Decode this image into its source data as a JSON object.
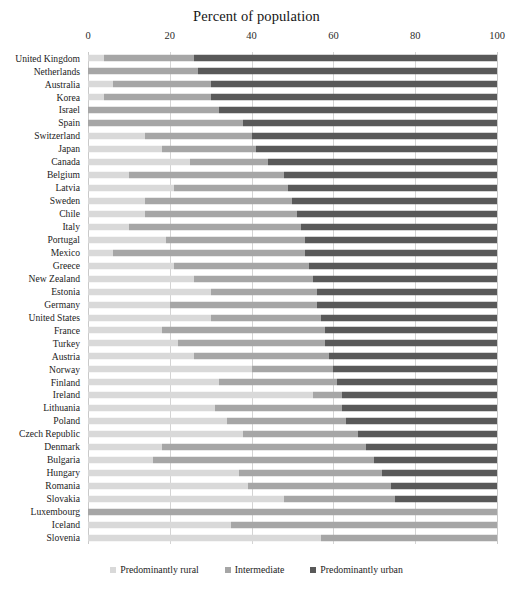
{
  "chart_data": {
    "type": "bar",
    "subtype": "stacked-horizontal-bar",
    "title": "Percent of population",
    "xlabel": "",
    "ylabel": "",
    "xlim": [
      0,
      100
    ],
    "xticks": [
      0,
      20,
      40,
      60,
      80,
      100
    ],
    "xtick_labels": [
      "0",
      "20",
      "40",
      "60",
      "80",
      "100"
    ],
    "grid": true,
    "grid_axis": "x",
    "legend_position": "bottom-center",
    "stacked_total": 100,
    "colors": {
      "rural": "#d9d9d9",
      "intermediate": "#a6a6a6",
      "urban": "#595959",
      "gridline": "#d4d4d4",
      "text": "#1c1c1c",
      "background": "#ffffff"
    },
    "legend": [
      {
        "label": "Predominantly rural",
        "key": "rural",
        "color": "#d9d9d9"
      },
      {
        "label": "Intermediate",
        "key": "intermediate",
        "color": "#a6a6a6"
      },
      {
        "label": "Predominantly urban",
        "key": "urban",
        "color": "#595959"
      }
    ],
    "categories": [
      "United Kingdom",
      "Netherlands",
      "Australia",
      "Korea",
      "Israel",
      "Spain",
      "Switzerland",
      "Japan",
      "Canada",
      "Belgium",
      "Latvia",
      "Sweden",
      "Chile",
      "Italy",
      "Portugal",
      "Mexico",
      "Greece",
      "New Zealand",
      "Estonia",
      "Germany",
      "United States",
      "France",
      "Turkey",
      "Austria",
      "Norway",
      "Finland",
      "Ireland",
      "Lithuania",
      "Poland",
      "Czech Republic",
      "Denmark",
      "Bulgaria",
      "Hungary",
      "Romania",
      "Slovakia",
      "Luxembourg",
      "Iceland",
      "Slovenia"
    ],
    "series": [
      {
        "name": "Predominantly rural",
        "key": "rural",
        "color": "#d9d9d9",
        "values": [
          4,
          0,
          6,
          4,
          0,
          0,
          14,
          18,
          25,
          10,
          21,
          14,
          14,
          10,
          19,
          6,
          21,
          26,
          30,
          20,
          30,
          18,
          22,
          26,
          40,
          32,
          55,
          31,
          34,
          38,
          18,
          16,
          37,
          39,
          48,
          0,
          35,
          57
        ]
      },
      {
        "name": "Intermediate",
        "key": "intermediate",
        "color": "#a6a6a6",
        "values": [
          22,
          27,
          24,
          26,
          32,
          38,
          26,
          23,
          19,
          38,
          28,
          36,
          37,
          42,
          34,
          47,
          33,
          29,
          26,
          36,
          27,
          40,
          36,
          33,
          20,
          29,
          7,
          31,
          29,
          28,
          50,
          54,
          35,
          35,
          27,
          100,
          65,
          43
        ]
      },
      {
        "name": "Predominantly urban",
        "key": "urban",
        "color": "#595959",
        "values": [
          74,
          73,
          70,
          70,
          68,
          62,
          60,
          59,
          56,
          52,
          51,
          50,
          49,
          48,
          47,
          47,
          46,
          45,
          44,
          44,
          43,
          42,
          42,
          41,
          40,
          39,
          38,
          38,
          37,
          34,
          32,
          30,
          28,
          26,
          25,
          0,
          0,
          0
        ]
      }
    ]
  }
}
